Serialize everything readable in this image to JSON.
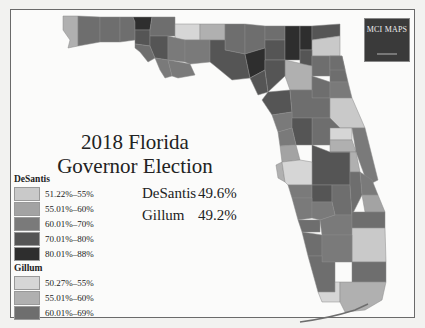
{
  "map": {
    "title_line1": "2018 Florida",
    "title_line2": "Governor Election",
    "logo_text": "MCI MAPS"
  },
  "results": [
    {
      "candidate": "DeSantis",
      "share": "49.6%"
    },
    {
      "candidate": "Gillum",
      "share": "49.2%"
    }
  ],
  "legend": {
    "desantis_label": "DeSantis",
    "desantis_bins": [
      {
        "range": "51.22%–55%",
        "color": "#c9c9c9"
      },
      {
        "range": "55.01%–60%",
        "color": "#a3a3a3"
      },
      {
        "range": "60.01%–70%",
        "color": "#7a7a7a"
      },
      {
        "range": "70.01%–80%",
        "color": "#555555"
      },
      {
        "range": "80.01%–88%",
        "color": "#2e2e2e"
      }
    ],
    "gillum_label": "Gillum",
    "gillum_bins": [
      {
        "range": "50.27%–55%",
        "color": "#d6d6d6"
      },
      {
        "range": "55.01%–60%",
        "color": "#b0b0b0"
      },
      {
        "range": "60.01%–69%",
        "color": "#6e6e6e"
      }
    ]
  },
  "colors": {
    "background": "#fbfbfa",
    "border": "#6a6a6a",
    "logo_bg": "#3a3a3a"
  }
}
